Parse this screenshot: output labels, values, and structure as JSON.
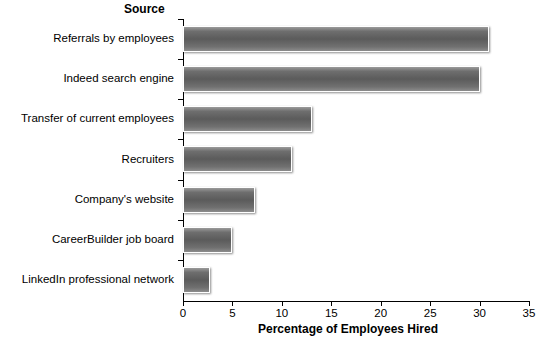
{
  "chart_data": {
    "type": "bar",
    "orientation": "horizontal",
    "title": "",
    "categories": [
      "Referrals by employees",
      "Indeed search engine",
      "Transfer of current employees",
      "Recruiters",
      "Company's website",
      "CareerBuilder job board",
      "LinkedIn professional network"
    ],
    "values": [
      31,
      30,
      13,
      11,
      7.3,
      5,
      2.7
    ],
    "xlabel": "Percentage of Employees Hired",
    "ylabel": "Source",
    "xlim": [
      0,
      35
    ],
    "xticks": [
      0,
      5,
      10,
      15,
      20,
      25,
      30,
      35
    ],
    "xtick_labels": [
      "0",
      "5",
      "10",
      "15",
      "20",
      "25",
      "30",
      "35"
    ],
    "grid": false,
    "legend": false,
    "bar_color": "#5b5b5b"
  },
  "axes": {
    "y_title": "Source",
    "x_title": "Percentage of Employees Hired"
  }
}
